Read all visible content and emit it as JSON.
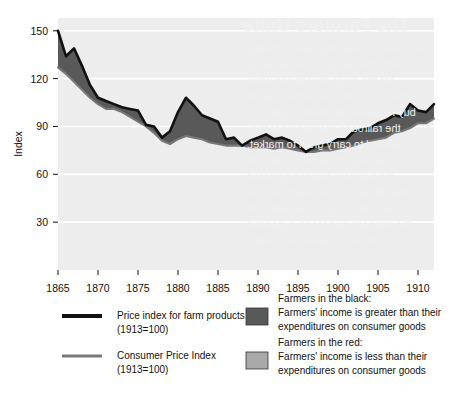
{
  "chart_data": {
    "type": "area",
    "title": "",
    "xlabel": "",
    "ylabel": "Index",
    "xlim": [
      1865,
      1912
    ],
    "ylim": [
      0,
      158
    ],
    "xticks": [
      1865,
      1870,
      1875,
      1880,
      1885,
      1890,
      1895,
      1900,
      1905,
      1910
    ],
    "yticks": [
      30,
      60,
      90,
      120,
      150
    ],
    "grid": "horizontal-white-on-gray",
    "legend_position": "below-plot",
    "x": [
      1865,
      1866,
      1867,
      1868,
      1869,
      1870,
      1871,
      1872,
      1873,
      1874,
      1875,
      1876,
      1877,
      1878,
      1879,
      1880,
      1881,
      1882,
      1883,
      1884,
      1885,
      1886,
      1887,
      1888,
      1889,
      1890,
      1891,
      1892,
      1893,
      1894,
      1895,
      1896,
      1897,
      1898,
      1899,
      1900,
      1901,
      1902,
      1903,
      1904,
      1905,
      1906,
      1907,
      1908,
      1909,
      1910,
      1911,
      1912
    ],
    "series": [
      {
        "name": "Price index for farm products (1913=100)",
        "key": "farm",
        "color": "#111111",
        "values": [
          150,
          134,
          139,
          128,
          116,
          108,
          106,
          104,
          102,
          101,
          100,
          91,
          90,
          83,
          87,
          99,
          108,
          103,
          97,
          95,
          93,
          82,
          83,
          78,
          81,
          83,
          85,
          82,
          83,
          81,
          78,
          74,
          77,
          78,
          79,
          82,
          82,
          87,
          88,
          89,
          92,
          94,
          97,
          96,
          104,
          100,
          99,
          104
        ]
      },
      {
        "name": "Consumer Price Index (1913=100)",
        "key": "cpi",
        "color": "#777777",
        "values": [
          127,
          123,
          118,
          113,
          108,
          104,
          101,
          101,
          99,
          96,
          93,
          90,
          86,
          81,
          79,
          82,
          84,
          83,
          82,
          80,
          79,
          78,
          78,
          78,
          77,
          77,
          77,
          76,
          77,
          76,
          75,
          74,
          74,
          75,
          75,
          76,
          77,
          78,
          80,
          81,
          82,
          83,
          86,
          87,
          89,
          92,
          92,
          95
        ]
      }
    ],
    "fill_bands": [
      {
        "name": "Farmers in the black",
        "color": "#595959",
        "condition": "farm > cpi"
      },
      {
        "name": "Farmers in the red",
        "color": "#a9a9a9",
        "condition": "farm < cpi"
      }
    ],
    "plot_background": "#ededed",
    "gridline_color": "#ffffff"
  },
  "legend": {
    "lines": [
      {
        "swatch": "line-black",
        "line1": "Price index for farm products",
        "line2": "(1913=100)"
      },
      {
        "swatch": "line-gray",
        "line1": "Consumer Price Index",
        "line2": "(1913=100)"
      }
    ],
    "bands": [
      {
        "swatch_color": "#595959",
        "line1": "Farmers in the black:",
        "line2": "Farmers' income is greater than their",
        "line3": "expenditures on consumer goods"
      },
      {
        "swatch_color": "#a9a9a9",
        "line1": "Farmers in the red:",
        "line2": "Farmers' income is less than their",
        "line3": "expenditures on consumer goods"
      }
    ]
  },
  "bleed_through": {
    "title": "The Farmers Unite",
    "lines": [
      "and made it clear they were unhappy",
      "with the way prices were falling",
      "for the crops they raised while",
      "the cost of the goods they had to",
      "buy remained stubbornly high, and",
      "the railroads charged what they",
      "pleased to carry grain to market.",
      "The Grange movement and later",
      "the Farmers Alliance gathered",
      "strength across the South and the",
      "Plains, pressing for regulation of",
      "the railroads and for an expanded",
      "currency to ease their debts."
    ]
  }
}
